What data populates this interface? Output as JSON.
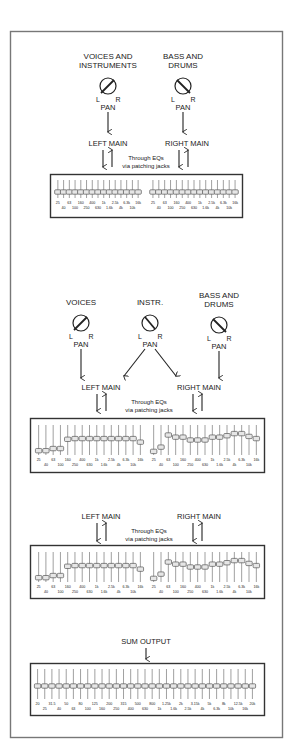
{
  "diagram": {
    "section1": {
      "sources": [
        {
          "label_lines": [
            "VOICES AND",
            "INSTRUMENTS"
          ],
          "pan": "left",
          "pan_label": "PAN",
          "l": "L",
          "r": "R"
        },
        {
          "label_lines": [
            "BASS AND",
            "DRUMS"
          ],
          "pan": "right",
          "pan_label": "PAN",
          "l": "L",
          "r": "R"
        }
      ],
      "left_main": "LEFT MAIN",
      "right_main": "RIGHT MAIN",
      "through_eqs": [
        "Through EQs",
        "via patching jacks"
      ],
      "eq": {
        "left": {
          "positions": [
            0,
            0,
            0,
            0,
            0,
            0,
            0,
            0,
            0,
            0,
            0,
            0,
            0,
            0,
            0
          ],
          "labels_top": [
            "25",
            "63",
            "160",
            "400",
            "1k",
            "2.5k",
            "6.3k",
            "16k"
          ],
          "labels_bottom": [
            "40",
            "100",
            "250",
            "630",
            "1.6k",
            "4k",
            "10k"
          ]
        },
        "right": {
          "positions": [
            0,
            0,
            0,
            0,
            0,
            0,
            0,
            0,
            0,
            0,
            0,
            0,
            0,
            0,
            0
          ],
          "labels_top": [
            "25",
            "63",
            "160",
            "400",
            "1k",
            "2.5k",
            "6.3k",
            "16k"
          ],
          "labels_bottom": [
            "40",
            "100",
            "250",
            "630",
            "1.6k",
            "4k",
            "10k"
          ]
        }
      }
    },
    "section2": {
      "sources": [
        {
          "label_lines": [
            "VOICES"
          ],
          "pan": "left",
          "pan_label": "PAN",
          "l": "L",
          "r": "R"
        },
        {
          "label_lines": [
            "INSTR."
          ],
          "pan": "center",
          "pan_label": "PAN",
          "l": "L",
          "r": "R"
        },
        {
          "label_lines": [
            "BASS AND",
            "DRUMS"
          ],
          "pan": "right",
          "pan_label": "PAN",
          "l": "L",
          "r": "R"
        }
      ],
      "left_main": "LEFT MAIN",
      "right_main": "RIGHT MAIN",
      "through_eqs": [
        "Through EQs",
        "via patching jacks"
      ],
      "eq": {
        "left": {
          "positions": [
            -0.75,
            -0.75,
            -0.6,
            -0.6,
            0.05,
            0.1,
            0.1,
            0.1,
            0.1,
            0.1,
            0.1,
            0.1,
            0.1,
            0.1,
            -0.15
          ],
          "labels_top": [
            "25",
            "63",
            "160",
            "400",
            "1k",
            "2.5k",
            "6.3k",
            "16k"
          ],
          "labels_bottom": [
            "40",
            "100",
            "250",
            "630",
            "1.6k",
            "4k",
            "10k"
          ]
        },
        "right": {
          "positions": [
            -0.8,
            -0.5,
            0.35,
            0.2,
            0.2,
            0.0,
            0.0,
            0.0,
            0.2,
            0.2,
            0.3,
            0.45,
            0.45,
            0.25,
            0.1
          ],
          "labels_top": [
            "25",
            "63",
            "160",
            "400",
            "1k",
            "2.5k",
            "6.3k",
            "16k"
          ],
          "labels_bottom": [
            "40",
            "100",
            "250",
            "630",
            "1.6k",
            "4k",
            "10k"
          ]
        }
      }
    },
    "section3": {
      "left_main": "LEFT MAIN",
      "right_main": "RIGHT MAIN",
      "through_eqs": [
        "Through EQs",
        "via patching jacks"
      ],
      "eq": {
        "left": {
          "positions": [
            -0.75,
            -0.75,
            -0.6,
            -0.6,
            0.05,
            0.1,
            0.1,
            0.1,
            0.1,
            0.1,
            0.1,
            0.1,
            0.1,
            0.1,
            -0.15
          ],
          "labels_top": [
            "25",
            "63",
            "160",
            "400",
            "1k",
            "2.5k",
            "6.3k",
            "16k"
          ],
          "labels_bottom": [
            "40",
            "100",
            "250",
            "630",
            "1.6k",
            "4k",
            "10k"
          ]
        },
        "right": {
          "positions": [
            -0.8,
            -0.5,
            0.35,
            0.2,
            0.2,
            0.0,
            0.0,
            0.0,
            0.2,
            0.2,
            0.3,
            0.45,
            0.45,
            0.25,
            0.1
          ],
          "labels_top": [
            "25",
            "63",
            "160",
            "400",
            "1k",
            "2.5k",
            "6.3k",
            "16k"
          ],
          "labels_bottom": [
            "40",
            "100",
            "250",
            "630",
            "1.6k",
            "4k",
            "10k"
          ]
        }
      }
    },
    "section4": {
      "sum_output": "SUM OUTPUT",
      "eq": {
        "bands": 31,
        "labels_top": [
          "20",
          "31.5",
          "50",
          "80",
          "125",
          "200",
          "315",
          "500",
          "800",
          "1.25k",
          "2k",
          "3.15k",
          "5k",
          "8k",
          "12.5k",
          "20k"
        ],
        "labels_bottom": [
          "25",
          "40",
          "63",
          "100",
          "160",
          "250",
          "400",
          "630",
          "1k",
          "1.6k",
          "2.5k",
          "4k",
          "6.3k",
          "10k",
          "16k"
        ]
      }
    }
  }
}
